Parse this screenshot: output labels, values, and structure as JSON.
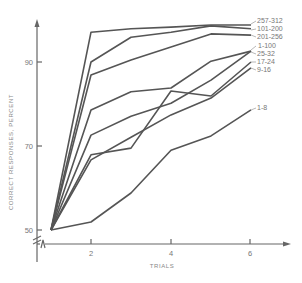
{
  "chart_data": {
    "type": "line",
    "title": "",
    "xlabel": "TRIALS",
    "ylabel": "CORRECT RESPONSES, PERCENT",
    "x": [
      1,
      2,
      3,
      4,
      5,
      6
    ],
    "x_ticks": [
      2,
      4,
      6
    ],
    "y_ticks": [
      50,
      70,
      90
    ],
    "xlim": [
      0.6,
      7.3
    ],
    "ylim": [
      46,
      101
    ],
    "y_axis_break": true,
    "grid": false,
    "legend_position": "inline-right",
    "series": [
      {
        "name": "257-312",
        "values": [
          50,
          97.1,
          97.9,
          98.3,
          98.8,
          98.8
        ]
      },
      {
        "name": "101-200",
        "values": [
          50,
          90.0,
          95.9,
          97.1,
          98.6,
          97.9
        ]
      },
      {
        "name": "201-256",
        "values": [
          50,
          86.9,
          90.5,
          93.6,
          96.7,
          96.4
        ]
      },
      {
        "name": "1-100",
        "values": [
          50,
          72.6,
          77.1,
          80.2,
          85.7,
          92.6
        ]
      },
      {
        "name": "25-32",
        "values": [
          50,
          78.6,
          82.9,
          83.8,
          90.2,
          92.6
        ]
      },
      {
        "name": "17-24",
        "values": [
          50,
          67.9,
          69.5,
          83.1,
          81.9,
          90.0
        ]
      },
      {
        "name": "9-16",
        "values": [
          50,
          66.7,
          72.1,
          77.4,
          81.4,
          88.6
        ]
      },
      {
        "name": "1-8",
        "values": [
          50,
          51.9,
          58.8,
          69.0,
          72.4,
          78.6
        ]
      }
    ]
  },
  "labels": {
    "x_axis_title": "TRIALS",
    "y_axis_title": "CORRECT RESPONSES, PERCENT",
    "x_tick_2": "2",
    "x_tick_4": "4",
    "x_tick_6": "6",
    "y_tick_50": "50",
    "y_tick_70": "70",
    "y_tick_90": "90",
    "series_257_312": "257-312",
    "series_101_200": "101-200",
    "series_201_256": "201-256",
    "series_1_100": "1-100",
    "series_25_32": "25-32",
    "series_17_24": "17-24",
    "series_9_16": "9-16",
    "series_1_8": "1-8"
  },
  "colors": {
    "line": "#555555",
    "axis": "#666666",
    "text": "#777777",
    "background": "#ffffff"
  }
}
